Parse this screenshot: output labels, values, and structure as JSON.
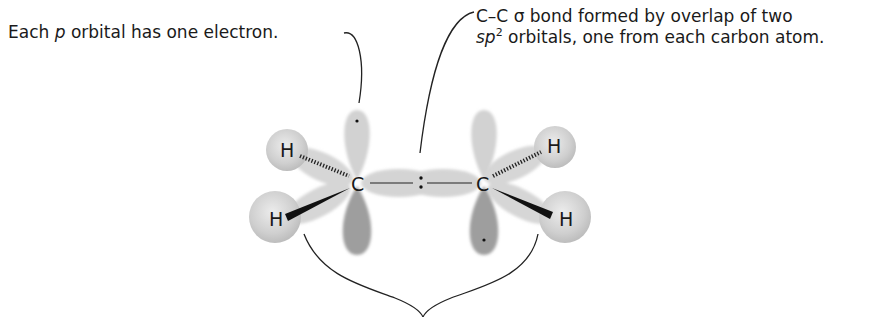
{
  "annotations": {
    "left": {
      "prefix": "Each ",
      "italic": "p",
      "suffix": " orbital has one electron."
    },
    "right": {
      "line1": "C–C σ bond formed by overlap of two",
      "line2_italic": "sp",
      "line2_sup": "2",
      "line2_rest": " orbitals, one from each carbon atom."
    }
  },
  "molecule": {
    "carbon_left": "C",
    "carbon_right": "C",
    "hydrogens": [
      "H",
      "H",
      "H",
      "H"
    ],
    "bond_center_symbol": ":"
  },
  "colors": {
    "orbital_light": "#d2d2d2",
    "orbital_dark": "#9a9a9a",
    "hydrogen_sphere": "#d6d6d6",
    "line": "#222222"
  }
}
